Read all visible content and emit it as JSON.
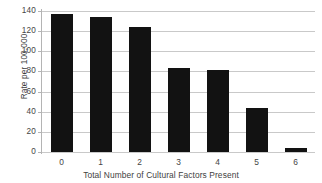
{
  "chart_data": {
    "type": "bar",
    "title": "",
    "subtitle": "",
    "xlabel": "Total Number of Cultural Factors Present",
    "ylabel": "Rate per 100,000",
    "categories": [
      "0",
      "1",
      "2",
      "3",
      "4",
      "5",
      "6"
    ],
    "values": [
      137,
      134,
      124,
      83,
      81,
      44,
      4
    ],
    "series": [
      {
        "name": "Rate per 100,000",
        "values": [
          137,
          134,
          124,
          83,
          81,
          44,
          4
        ]
      }
    ],
    "ylim": [
      0,
      140
    ],
    "yticks": [
      0,
      20,
      40,
      60,
      80,
      100,
      120,
      140
    ],
    "ytick_labels": [
      "0",
      "20",
      "40",
      "60",
      "80",
      "100",
      "120",
      "140"
    ],
    "xtick_labels": [
      "0",
      "1",
      "2",
      "3",
      "4",
      "5",
      "6"
    ],
    "grid": "horizontal",
    "legend": "none",
    "bar_color": "#121212",
    "gridline_color": "#c9c9c9",
    "axis_color": "#b4b4b4",
    "background_color": "#ffffff",
    "annotations": []
  }
}
